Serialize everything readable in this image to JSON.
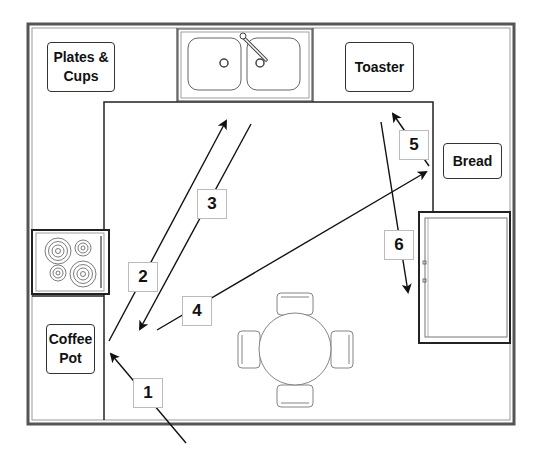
{
  "diagram": {
    "type": "kitchen floor plan with work-triangle path",
    "stations": {
      "plates_cups": "Plates & Cups",
      "toaster": "Toaster",
      "bread": "Bread",
      "coffee_pot_line1": "Coffee",
      "coffee_pot_line2": "Pot"
    },
    "fixtures": [
      "double sink with faucet",
      "four-burner stove",
      "refrigerator",
      "round table with four chairs"
    ],
    "steps": [
      {
        "n": "1",
        "from": "entrance (bottom)",
        "to": "Coffee Pot"
      },
      {
        "n": "2",
        "from": "Coffee Pot",
        "to": "Sink"
      },
      {
        "n": "3",
        "from": "Sink",
        "to": "Coffee Pot area"
      },
      {
        "n": "4",
        "from": "Coffee Pot area",
        "to": "Bread"
      },
      {
        "n": "5",
        "from": "Bread",
        "to": "Toaster"
      },
      {
        "n": "6",
        "from": "Toaster",
        "to": "Refrigerator"
      }
    ],
    "colors": {
      "line": "#222222",
      "wall_gray": "#888888",
      "fixture": "#555555",
      "background": "#ffffff"
    }
  }
}
